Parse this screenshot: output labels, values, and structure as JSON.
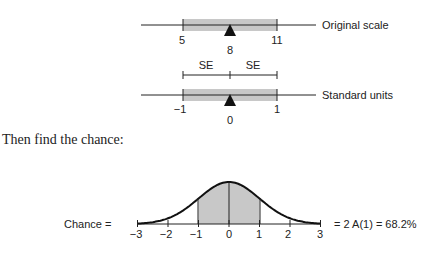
{
  "top_diagram": {
    "original_scale": {
      "label": "Original scale",
      "ticks": [
        "5",
        "8",
        "11"
      ]
    },
    "se_labels": [
      "SE",
      "SE"
    ],
    "standard_units": {
      "label": "Standard units",
      "ticks": [
        "−1",
        "0",
        "1"
      ]
    }
  },
  "instruction": "Then find the chance:",
  "bottom_diagram": {
    "left_label": "Chance =",
    "right_label": "= 2 A(1) = 68.2%",
    "ticks": [
      "−3",
      "−2",
      "−1",
      "0",
      "1",
      "2",
      "3"
    ]
  },
  "colors": {
    "shade": "#c8c8c8",
    "line": "#222222"
  }
}
